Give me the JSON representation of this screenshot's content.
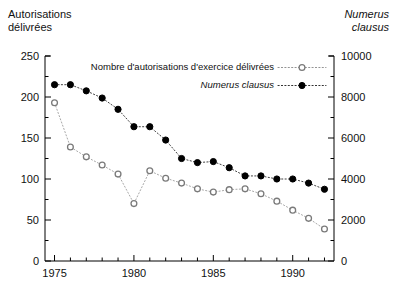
{
  "titles": {
    "left_axis_title": "Autorisations\ndélivrées",
    "right_axis_title": "Numerus\nclausus"
  },
  "legend": {
    "entry1": "Nombre d'autorisations d'exercice délivrées",
    "entry2": "Numerus clausus"
  },
  "colors": {
    "axis": "#000000",
    "series_open": "#7a7a7a",
    "series_filled": "#000000",
    "background": "#ffffff"
  },
  "chart_data": {
    "type": "line",
    "title": "",
    "subtitle": "",
    "xlabel": "",
    "ylabel": "Autorisations délivrées",
    "y2label": "Numerus clausus",
    "grid": false,
    "legend_position": "top-right",
    "xlim": [
      1974.4,
      1992.6
    ],
    "ylim": [
      0,
      250
    ],
    "y2lim": [
      0,
      10000
    ],
    "xticks": [
      1975,
      1980,
      1985,
      1990
    ],
    "xticks_minor": [
      1976,
      1977,
      1978,
      1979,
      1981,
      1982,
      1983,
      1984,
      1986,
      1987,
      1988,
      1989,
      1991,
      1992
    ],
    "yticks": [
      0,
      50,
      100,
      150,
      200,
      250
    ],
    "yticks_minor": [
      25,
      75,
      125,
      175,
      225
    ],
    "y2ticks": [
      0,
      2000,
      4000,
      6000,
      8000,
      10000
    ],
    "y2ticks_minor": [
      1000,
      3000,
      5000,
      7000,
      9000
    ],
    "x": [
      1975,
      1976,
      1977,
      1978,
      1979,
      1980,
      1981,
      1982,
      1983,
      1984,
      1985,
      1986,
      1987,
      1988,
      1989,
      1990,
      1991,
      1992
    ],
    "series": [
      {
        "name": "Nombre d'autorisations d'exercice délivrées",
        "axis": "left",
        "marker": "open-circle",
        "values": [
          193,
          139,
          127,
          117,
          106,
          70,
          110,
          101,
          95,
          88,
          84,
          87,
          88,
          82,
          73,
          62,
          52,
          39
        ]
      },
      {
        "name": "Numerus clausus",
        "axis": "right",
        "marker": "filled-circle",
        "values": [
          8600,
          8600,
          8300,
          7950,
          7400,
          6550,
          6550,
          5900,
          5000,
          4800,
          4850,
          4550,
          4150,
          4150,
          4000,
          4000,
          3800,
          3500
        ]
      }
    ]
  }
}
